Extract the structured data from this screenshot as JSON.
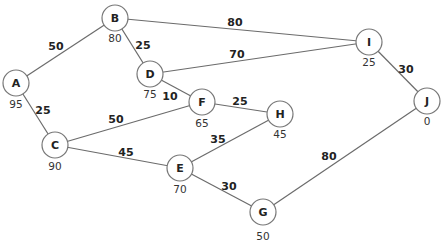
{
  "graph": {
    "nodes": [
      {
        "id": "A",
        "label": "A",
        "value": "95",
        "x": 16,
        "y": 83,
        "vx": 16,
        "vy": 104
      },
      {
        "id": "B",
        "label": "B",
        "value": "80",
        "x": 115,
        "y": 18,
        "vx": 115,
        "vy": 38
      },
      {
        "id": "C",
        "label": "C",
        "value": "90",
        "x": 55,
        "y": 145,
        "vx": 55,
        "vy": 166
      },
      {
        "id": "D",
        "label": "D",
        "value": "75",
        "x": 150,
        "y": 74,
        "vx": 150,
        "vy": 94
      },
      {
        "id": "E",
        "label": "E",
        "value": "70",
        "x": 180,
        "y": 168,
        "vx": 180,
        "vy": 189
      },
      {
        "id": "F",
        "label": "F",
        "value": "65",
        "x": 202,
        "y": 102,
        "vx": 202,
        "vy": 123
      },
      {
        "id": "G",
        "label": "G",
        "value": "50",
        "x": 263,
        "y": 212,
        "vx": 263,
        "vy": 236
      },
      {
        "id": "H",
        "label": "H",
        "value": "45",
        "x": 280,
        "y": 114,
        "vx": 280,
        "vy": 134
      },
      {
        "id": "I",
        "label": "I",
        "value": "25",
        "x": 369,
        "y": 42,
        "vx": 369,
        "vy": 62
      },
      {
        "id": "J",
        "label": "J",
        "value": "0",
        "x": 427,
        "y": 101,
        "vx": 427,
        "vy": 121
      }
    ],
    "edges": [
      {
        "from": "A",
        "to": "B",
        "weight": "50",
        "lx": 56,
        "ly": 46
      },
      {
        "from": "A",
        "to": "C",
        "weight": "25",
        "lx": 43,
        "ly": 110
      },
      {
        "from": "B",
        "to": "D",
        "weight": "25",
        "lx": 143,
        "ly": 45
      },
      {
        "from": "B",
        "to": "I",
        "weight": "80",
        "lx": 235,
        "ly": 22
      },
      {
        "from": "D",
        "to": "I",
        "weight": "70",
        "lx": 237,
        "ly": 54
      },
      {
        "from": "D",
        "to": "F",
        "weight": "10",
        "lx": 170,
        "ly": 96
      },
      {
        "from": "C",
        "to": "F",
        "weight": "50",
        "lx": 116,
        "ly": 119
      },
      {
        "from": "C",
        "to": "E",
        "weight": "45",
        "lx": 126,
        "ly": 152
      },
      {
        "from": "F",
        "to": "H",
        "weight": "25",
        "lx": 240,
        "ly": 101
      },
      {
        "from": "E",
        "to": "H",
        "weight": "35",
        "lx": 218,
        "ly": 139
      },
      {
        "from": "E",
        "to": "G",
        "weight": "30",
        "lx": 229,
        "ly": 186
      },
      {
        "from": "I",
        "to": "J",
        "weight": "30",
        "lx": 406,
        "ly": 69
      },
      {
        "from": "J",
        "to": "G",
        "weight": "80",
        "lx": 329,
        "ly": 156
      }
    ]
  }
}
